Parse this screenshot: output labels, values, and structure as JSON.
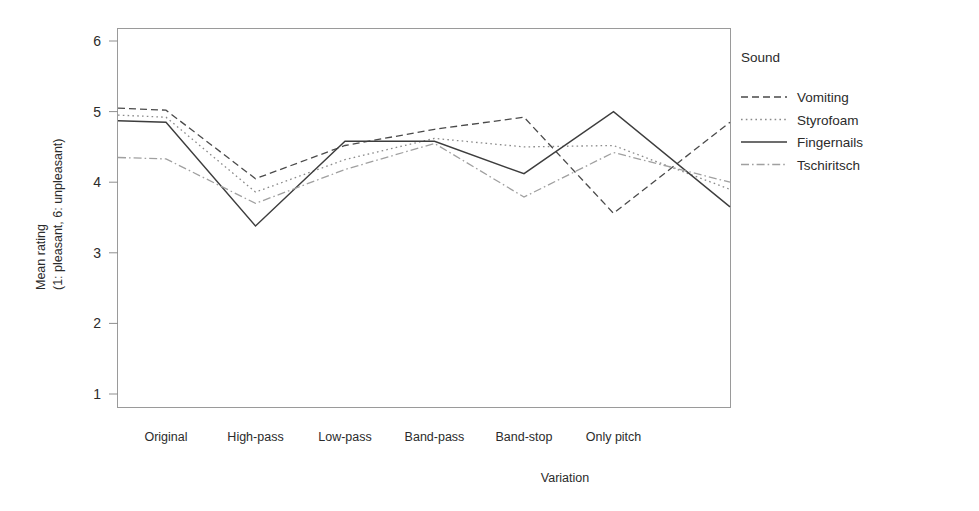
{
  "chart_data": {
    "type": "line",
    "title": "",
    "xlabel": "Variation",
    "ylabel_line1": "Mean rating",
    "ylabel_line2": "(1: pleasant, 6: unpleasant)",
    "categories": [
      "Original",
      "High-pass",
      "Low-pass",
      "Band-pass",
      "Band-stop",
      "Only pitch"
    ],
    "ylim": [
      1,
      6
    ],
    "yticks": [
      "1",
      "2",
      "3",
      "4",
      "5",
      "6"
    ],
    "grid": false,
    "legend_position": "right",
    "legend_title": "Sound",
    "series": [
      {
        "name": "Vomiting",
        "style": "dashed",
        "color": "#4a4a4a",
        "values": [
          5.02,
          4.05,
          4.52,
          4.75,
          4.92,
          3.56
        ],
        "edge_start": 5.05,
        "edge_end": 4.85
      },
      {
        "name": "Styrofoam",
        "style": "dotted",
        "color": "#8a8a8a",
        "values": [
          4.92,
          3.86,
          4.32,
          4.62,
          4.5,
          4.52
        ],
        "edge_start": 4.95,
        "edge_end": 3.9
      },
      {
        "name": "Fingernails",
        "style": "solid",
        "color": "#3d3d3d",
        "values": [
          4.85,
          3.38,
          4.58,
          4.58,
          4.12,
          5.0
        ],
        "edge_start": 4.87,
        "edge_end": 3.65
      },
      {
        "name": "Tschiritsch",
        "style": "dashdot",
        "color": "#a0a0a0",
        "values": [
          4.33,
          3.7,
          4.18,
          4.55,
          3.79,
          4.42
        ],
        "edge_start": 4.35,
        "edge_end": 4.0
      }
    ]
  }
}
